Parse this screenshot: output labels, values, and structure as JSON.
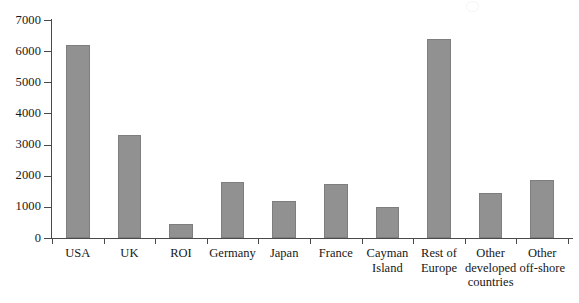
{
  "chart_data": {
    "type": "bar",
    "title": "",
    "subtitle": "",
    "xlabel": "",
    "ylabel": "",
    "categories": [
      "USA",
      "UK",
      "ROI",
      "Germany",
      "Japan",
      "France",
      "Cayman Island",
      "Rest of Europe",
      "Other developed countries",
      "Other off-shore"
    ],
    "category_lines": [
      [
        "USA"
      ],
      [
        "UK"
      ],
      [
        "ROI"
      ],
      [
        "Germany"
      ],
      [
        "Japan"
      ],
      [
        "France"
      ],
      [
        "Cayman",
        "Island"
      ],
      [
        "Rest of",
        "Europe"
      ],
      [
        "Other",
        "developed",
        "countries"
      ],
      [
        "Other",
        "off-shore"
      ]
    ],
    "values": [
      6200,
      3300,
      450,
      1800,
      1200,
      1750,
      980,
      6400,
      1450,
      1850
    ],
    "ylim": [
      0,
      7000
    ],
    "yticks": [
      0,
      1000,
      2000,
      3000,
      4000,
      5000,
      6000,
      7000
    ],
    "ytick_labels": [
      "0",
      "1000",
      "2000",
      "3000",
      "4000",
      "5000",
      "6000",
      "7000"
    ],
    "grid": false,
    "legend": null,
    "legend_position": "none",
    "bar_color": "#919191",
    "bar_edge_color": "#7e7e7e",
    "axis_color": "#4a4a4a",
    "text_color": "#171717",
    "background_color": "#ffffff"
  }
}
